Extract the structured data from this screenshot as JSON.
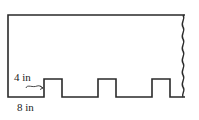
{
  "diagram": {
    "type": "notched-board-outline",
    "stroke_color": "#2a2a2a",
    "labels": {
      "tab_height": "4 in",
      "segment_width": "8 in"
    },
    "tabs_visible": 3
  }
}
